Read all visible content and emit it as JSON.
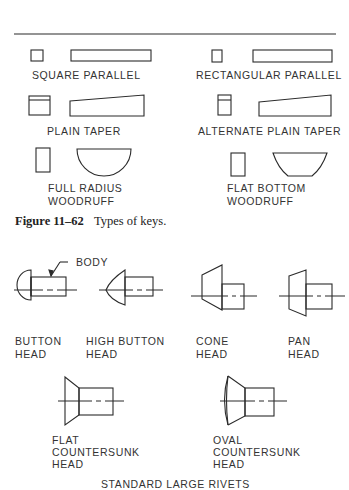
{
  "figure_keys": {
    "caption_number": "Figure 11–62",
    "caption_text": "Types of keys.",
    "keys": [
      {
        "id": "square-parallel",
        "label": "SQUARE PARALLEL"
      },
      {
        "id": "rectangular-parallel",
        "label": "RECTANGULAR PARALLEL"
      },
      {
        "id": "plain-taper",
        "label": "PLAIN TAPER"
      },
      {
        "id": "alternate-plain-taper",
        "label": "ALTERNATE PLAIN TAPER"
      },
      {
        "id": "full-radius-woodruff",
        "label_line1": "FULL RADIUS",
        "label_line2": "WOODRUFF"
      },
      {
        "id": "flat-bottom-woodruff",
        "label_line1": "FLAT BOTTOM",
        "label_line2": "WOODRUFF"
      }
    ]
  },
  "figure_rivets": {
    "title": "STANDARD LARGE RIVETS",
    "callout": "BODY",
    "rivets": [
      {
        "id": "button-head",
        "label_line1": "BUTTON",
        "label_line2": "HEAD"
      },
      {
        "id": "high-button-head",
        "label_line1": "HIGH BUTTON",
        "label_line2": "HEAD"
      },
      {
        "id": "cone-head",
        "label_line1": "CONE",
        "label_line2": "HEAD"
      },
      {
        "id": "pan-head",
        "label_line1": "PAN",
        "label_line2": "HEAD"
      },
      {
        "id": "flat-countersunk-head",
        "label_line1": "FLAT",
        "label_line2": "COUNTERSUNK",
        "label_line3": "HEAD"
      },
      {
        "id": "oval-countersunk-head",
        "label_line1": "OVAL",
        "label_line2": "COUNTERSUNK",
        "label_line3": "HEAD"
      }
    ]
  },
  "colors": {
    "line": "#2a2a2a",
    "background": "#ffffff"
  }
}
